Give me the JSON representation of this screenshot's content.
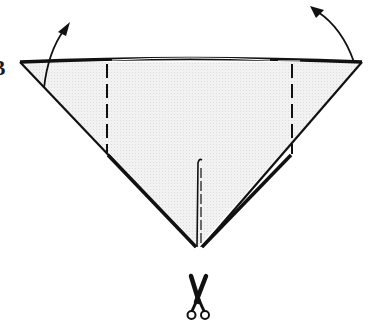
{
  "diagram": {
    "edge_text_top": "",
    "edge_text_left": "B",
    "colors": {
      "paper_fill": "#eeeeee",
      "line": "#111111",
      "background": "#ffffff"
    },
    "shape": {
      "type": "inverted-triangle",
      "top_left": [
        20,
        62
      ],
      "top_right": [
        362,
        62
      ],
      "bottom": [
        198,
        247
      ]
    },
    "fold_lines": [
      {
        "name": "left-fold",
        "x": 107,
        "y_start": 63,
        "y_end": 153,
        "style": "dashed"
      },
      {
        "name": "right-fold",
        "x": 292,
        "y_start": 63,
        "y_end": 154,
        "style": "dashed"
      }
    ],
    "arrows": [
      {
        "name": "left-corner-arrow",
        "direction": "up-right"
      },
      {
        "name": "right-corner-arrow",
        "direction": "up-left"
      }
    ],
    "cut_line": {
      "x": 200,
      "y_start": 160,
      "y_end": 247
    },
    "scissors_icon": "scissors-icon"
  }
}
